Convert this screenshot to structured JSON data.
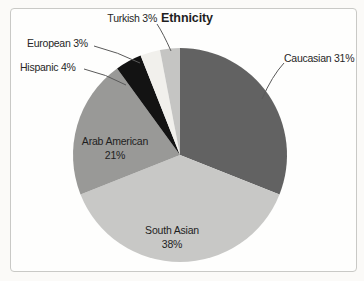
{
  "chart": {
    "title": "Ethnicity"
  },
  "chart_data": {
    "type": "pie",
    "title": "Ethnicity",
    "categories": [
      "Caucasian",
      "South Asian",
      "Arab American",
      "Hispanic",
      "European",
      "Turkish"
    ],
    "values": [
      31,
      38,
      21,
      4,
      3,
      3
    ],
    "unit": "%",
    "colors": [
      "#626262",
      "#c8c8c6",
      "#999997",
      "#131313",
      "#f1f0ec",
      "#c5c5c3"
    ],
    "start_angle_deg": 0,
    "direction": "clockwise",
    "legend_position": "none",
    "labels": {
      "caucasian": "Caucasian 31%",
      "turkish": "Turkish 3%",
      "european": "European 3%",
      "hispanic": "Hispanic 4%",
      "arab_american_line1": "Arab American",
      "arab_american_line2": "21%",
      "south_asian_line1": "South Asian",
      "south_asian_line2": "38%"
    }
  }
}
